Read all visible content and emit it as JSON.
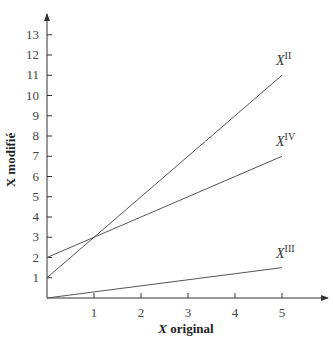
{
  "chart_data": {
    "type": "line",
    "title": "",
    "xlabel": "X original",
    "ylabel": "X modifié",
    "xlim": [
      0,
      5.5
    ],
    "ylim": [
      0,
      13.5
    ],
    "x_ticks": [
      "1",
      "2",
      "3",
      "4",
      "5"
    ],
    "y_ticks": [
      "1",
      "2",
      "3",
      "4",
      "5",
      "6",
      "7",
      "8",
      "9",
      "10",
      "11",
      "12",
      "13"
    ],
    "grid": false,
    "legend": "inline labels at line ends",
    "series": [
      {
        "name": "X^II",
        "label_base": "X",
        "label_sup": "II",
        "x": [
          0,
          5
        ],
        "y": [
          1,
          11
        ]
      },
      {
        "name": "X^IV",
        "label_base": "X",
        "label_sup": "IV",
        "x": [
          0,
          5
        ],
        "y": [
          2,
          7
        ]
      },
      {
        "name": "X^III",
        "label_base": "X",
        "label_sup": "III",
        "x": [
          0,
          5
        ],
        "y": [
          0,
          1.5
        ]
      }
    ]
  },
  "axes": {
    "x_title_base": "X",
    "x_title_rest": " original",
    "y_title": "X modifié"
  },
  "line_color": "#555555"
}
